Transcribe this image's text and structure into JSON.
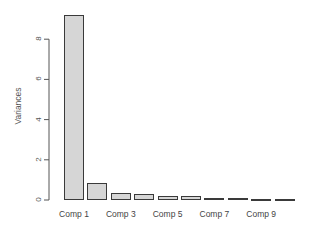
{
  "chart_data": {
    "type": "bar",
    "title": "",
    "xlabel": "",
    "ylabel": "Variances",
    "categories": [
      "Comp 1",
      "Comp 2",
      "Comp 3",
      "Comp 4",
      "Comp 5",
      "Comp 6",
      "Comp 7",
      "Comp 8",
      "Comp 9",
      "Comp 10"
    ],
    "values": [
      9.2,
      0.85,
      0.33,
      0.28,
      0.21,
      0.18,
      0.12,
      0.09,
      0.07,
      0.05
    ],
    "visible_xticklabels": [
      "Comp 1",
      "Comp 3",
      "Comp 5",
      "Comp 7",
      "Comp 9"
    ],
    "yticks": [
      0,
      2,
      4,
      6,
      8
    ],
    "ylim": [
      0,
      9.2
    ],
    "grid": false,
    "bar_fill": "#d6d6d6",
    "bar_edge": "#3a3a3a"
  }
}
